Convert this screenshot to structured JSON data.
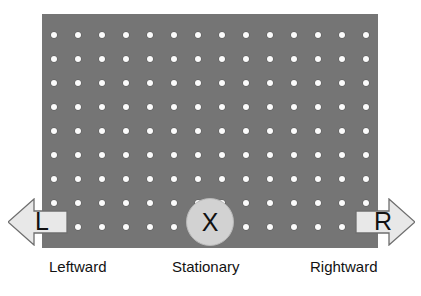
{
  "stimulus": {
    "field": {
      "name": "random-dot-field",
      "background_color": "#757575",
      "dot_color": "#fbfbfb",
      "columns": 14,
      "rows": 9,
      "dot_spacing_px": 24,
      "dot_diameter_px": 6,
      "x_px": 42,
      "y_px": 14,
      "width_px": 336,
      "height_px": 234
    },
    "options": [
      {
        "key": "left",
        "marker": "L",
        "caption": "Leftward",
        "shape": "arrow-left",
        "fill_color": "#e8e8e8",
        "stroke_color": "#6e6e6e"
      },
      {
        "key": "center",
        "marker": "X",
        "caption": "Stationary",
        "shape": "circle",
        "fill_color": "#d2d2d2",
        "stroke_color": "#b8b8b8"
      },
      {
        "key": "right",
        "marker": "R",
        "caption": "Rightward",
        "shape": "arrow-right",
        "fill_color": "#e8e8e8",
        "stroke_color": "#6e6e6e"
      }
    ]
  }
}
